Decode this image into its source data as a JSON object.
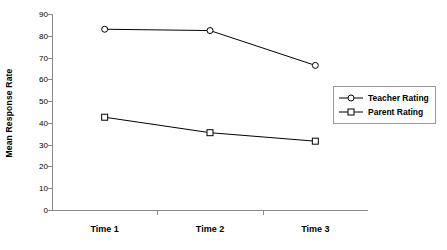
{
  "chart_data": {
    "type": "line",
    "title": "",
    "xlabel": "",
    "ylabel": "Mean Response Rate",
    "categories": [
      "Time 1",
      "Time 2",
      "Time 3"
    ],
    "ylim": [
      0,
      90
    ],
    "yticks": [
      0,
      10,
      20,
      30,
      40,
      50,
      60,
      70,
      80,
      90
    ],
    "ytick_labels": [
      "0",
      "10",
      "20",
      "30",
      "40",
      "50",
      "60",
      "70",
      "80",
      "90"
    ],
    "grid": false,
    "legend_position": "right",
    "series": [
      {
        "name": "Teacher Rating",
        "marker": "circle",
        "color": "#000000",
        "values": [
          83.0,
          82.4,
          66.4
        ]
      },
      {
        "name": "Parent Rating",
        "marker": "square",
        "color": "#000000",
        "values": [
          42.6,
          35.5,
          31.6
        ]
      }
    ]
  },
  "legend": {
    "items": [
      {
        "label": "Teacher Rating",
        "marker": "circle"
      },
      {
        "label": "Parent Rating",
        "marker": "square"
      }
    ]
  }
}
